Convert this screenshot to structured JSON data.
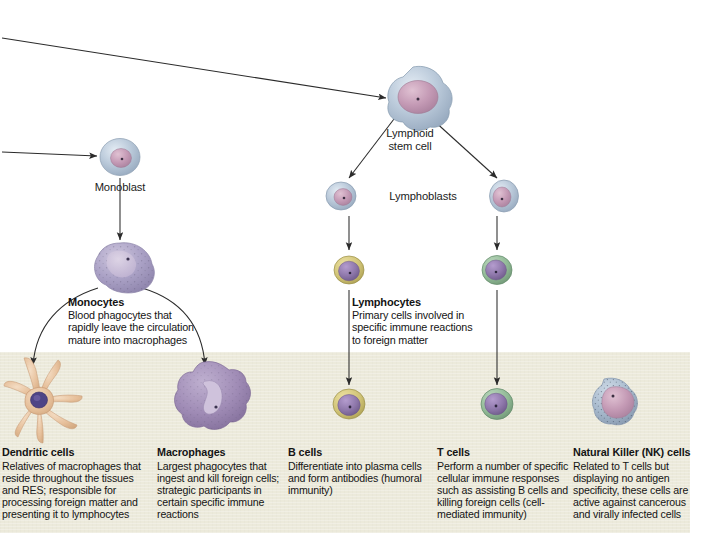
{
  "diagram": {
    "band_color": "#eceadb",
    "line_color": "#2b2b2b"
  },
  "nodes": {
    "lymphoid_stem_cell": "Lymphoid\nstem cell",
    "lymphoid_stem_cell_line1": "Lymphoid",
    "lymphoid_stem_cell_line2": "stem cell",
    "monoblast": "Monoblast",
    "lymphoblasts": "Lymphoblasts"
  },
  "mid_labels": [
    {
      "id": "monocytes",
      "heading": "Monocytes",
      "lines": [
        "Blood phagocytes that",
        "rapidly leave the circulation",
        "mature into macrophages"
      ]
    },
    {
      "id": "lymphocytes",
      "heading": "Lymphocytes",
      "lines": [
        "Primary cells involved in",
        "specific immune reactions",
        "to foreign matter"
      ]
    }
  ],
  "captions": [
    {
      "id": "dendritic-cells",
      "heading": "Dendritic cells",
      "lines": [
        "Relatives of macrophages that",
        "reside throughout the tissues",
        "and RES; responsible for",
        "processing foreign matter and",
        "presenting it to lymphocytes"
      ]
    },
    {
      "id": "macrophages",
      "heading": "Macrophages",
      "lines": [
        "Largest phagocytes that",
        "ingest and kill foreign cells;",
        "strategic participants in",
        "certain specific immune",
        "reactions"
      ]
    },
    {
      "id": "b-cells",
      "heading": "B cells",
      "lines": [
        "Differentiate into plasma cells",
        "and form antibodies (humoral",
        "immunity)"
      ]
    },
    {
      "id": "t-cells",
      "heading": "T cells",
      "lines": [
        "Perform a number of specific",
        "cellular immune responses",
        "such as assisting B cells and",
        "killing foreign cells (cell-",
        "mediated immunity)"
      ]
    },
    {
      "id": "nk-cells",
      "heading": "Natural Killer (NK) cells",
      "lines": [
        "Related to T cells but",
        "displaying no antigen",
        "specificity, these cells are",
        "active against cancerous",
        "and virally infected cells"
      ]
    }
  ],
  "cells": [
    {
      "id": "lymphoid-stem-cell-graphic",
      "shape": "stellate-blast",
      "cytoplasm": "#b6c4d6",
      "nucleus": "#c49ab5"
    },
    {
      "id": "monoblast-graphic",
      "shape": "round-blast",
      "cytoplasm": "#aebfd3",
      "nucleus": "#c9a3bb"
    },
    {
      "id": "lymphoblast-left-graphic",
      "shape": "round-blast",
      "cytoplasm": "#b3c1d2",
      "nucleus": "#c09ab4"
    },
    {
      "id": "lymphoblast-right-graphic",
      "shape": "round-blast",
      "cytoplasm": "#b3c1d2",
      "nucleus": "#b794ae"
    },
    {
      "id": "monocyte-graphic",
      "shape": "monocyte",
      "cytoplasm": "#a9a2c4",
      "nucleus": "#c6b6d2"
    },
    {
      "id": "b-cell-upper-graphic",
      "shape": "ringed-lymphocyte",
      "cytoplasm": "#cfc275",
      "nucleus": "#8a6ea8"
    },
    {
      "id": "t-cell-upper-graphic",
      "shape": "ringed-lymphocyte",
      "cytoplasm": "#8fb894",
      "nucleus": "#8f78ab"
    },
    {
      "id": "dendritic-cell-graphic",
      "shape": "dendritic",
      "cytoplasm": "#e6bf9a",
      "nucleus": "#4f4486"
    },
    {
      "id": "macrophage-graphic",
      "shape": "macrophage",
      "cytoplasm": "#a08cb6",
      "nucleus": "#b9a8c8"
    },
    {
      "id": "b-cell-lower-graphic",
      "shape": "ringed-lymphocyte",
      "cytoplasm": "#cfc275",
      "nucleus": "#8a6ea8"
    },
    {
      "id": "t-cell-lower-graphic",
      "shape": "ringed-lymphocyte",
      "cytoplasm": "#8fb894",
      "nucleus": "#8f78ab"
    },
    {
      "id": "nk-cell-graphic",
      "shape": "granular-nk",
      "cytoplasm": "#a8bacd",
      "nucleus": "#c6a7bd"
    }
  ],
  "arrows": [
    {
      "id": "arrow-incoming-to-lymphoid-stem-cell",
      "from": "left-edge",
      "to": "lymphoid-stem-cell"
    },
    {
      "id": "arrow-incoming-to-monoblast",
      "from": "left-edge",
      "to": "monoblast"
    },
    {
      "id": "arrow-lymphoid-stem-to-lymphoblast-left",
      "from": "lymphoid-stem-cell",
      "to": "lymphoblast-left"
    },
    {
      "id": "arrow-lymphoid-stem-to-lymphoblast-right",
      "from": "lymphoid-stem-cell",
      "to": "lymphoblast-right"
    },
    {
      "id": "arrow-monoblast-to-monocyte",
      "from": "monoblast",
      "to": "monocyte"
    },
    {
      "id": "arrow-lymphoblast-left-to-b-cell",
      "from": "lymphoblast-left",
      "to": "b-cell-upper"
    },
    {
      "id": "arrow-lymphoblast-right-to-t-cell",
      "from": "lymphoblast-right",
      "to": "t-cell-upper"
    },
    {
      "id": "arrow-monocyte-to-dendritic-cell",
      "from": "monocyte",
      "to": "dendritic-cell"
    },
    {
      "id": "arrow-monocyte-to-macrophage",
      "from": "monocyte",
      "to": "macrophage"
    },
    {
      "id": "arrow-b-cell-upper-to-b-cell-lower",
      "from": "b-cell-upper",
      "to": "b-cell-lower"
    },
    {
      "id": "arrow-t-cell-upper-to-t-cell-lower",
      "from": "t-cell-upper",
      "to": "t-cell-lower"
    }
  ]
}
